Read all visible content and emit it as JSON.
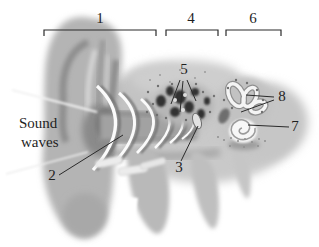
{
  "figure": {
    "background_color": "#ffffff",
    "ink_color": "#1f1f1f"
  },
  "labels": {
    "region_1": "1",
    "region_4": "4",
    "region_6": "6",
    "pointer_2": "2",
    "pointer_3": "3",
    "pointer_5": "5",
    "pointer_7": "7",
    "pointer_8": "8",
    "sound_line1": "Sound",
    "sound_line2": "waves"
  },
  "annotations": {
    "brackets": [
      {
        "label": "1",
        "x1": 44,
        "x2": 156,
        "y": 30,
        "tick": 6
      },
      {
        "label": "4",
        "x1": 166,
        "x2": 218,
        "y": 30,
        "tick": 6
      },
      {
        "label": "6",
        "x1": 226,
        "x2": 281,
        "y": 30,
        "tick": 6
      }
    ],
    "leader_lines": [
      {
        "label": "2",
        "from": [
          59,
          175
        ],
        "to": [
          123,
          135
        ]
      },
      {
        "label": "3",
        "from": [
          181,
          161
        ],
        "to": [
          198,
          126
        ]
      },
      {
        "label": "5",
        "from": [
          180,
          80
        ],
        "to": [
          171,
          104
        ]
      },
      {
        "label": "5",
        "from": [
          183,
          81
        ],
        "to": [
          180,
          112
        ]
      },
      {
        "label": "5",
        "from": [
          187,
          80
        ],
        "to": [
          196,
          101
        ]
      },
      {
        "label": "7",
        "from": [
          289,
          127
        ],
        "to": [
          248,
          125
        ]
      },
      {
        "label": "8",
        "from": [
          274,
          97
        ],
        "to": [
          246,
          95
        ]
      },
      {
        "label": "8",
        "from": [
          274,
          100
        ],
        "to": [
          241,
          112
        ]
      }
    ]
  }
}
